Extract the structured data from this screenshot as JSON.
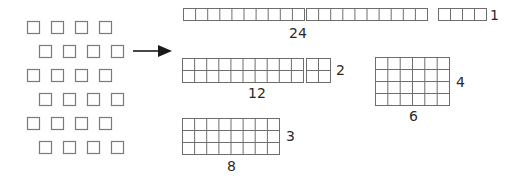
{
  "diagram": {
    "source_squares": {
      "rows": 6,
      "per_row": 4,
      "total": 24
    },
    "arrow": "right-arrow",
    "arrays": [
      {
        "id": "24x1",
        "columns": 24,
        "rows": 1,
        "width_label": "24",
        "height_label": "1",
        "segments": [
          10,
          10,
          4
        ]
      },
      {
        "id": "12x2",
        "columns": 12,
        "rows": 2,
        "width_label": "12",
        "height_label": "2",
        "segments": [
          10,
          2
        ]
      },
      {
        "id": "6x4",
        "columns": 6,
        "rows": 4,
        "width_label": "6",
        "height_label": "4",
        "segments": [
          6
        ]
      },
      {
        "id": "8x3",
        "columns": 8,
        "rows": 3,
        "width_label": "8",
        "height_label": "3",
        "segments": [
          8
        ]
      }
    ]
  },
  "labels": {
    "a24_width": "24",
    "a24_height": "1",
    "a12_width": "12",
    "a12_height": "2",
    "a6_width": "6",
    "a6_height": "4",
    "a8_width": "8",
    "a8_height": "3"
  },
  "colors": {
    "square_stroke": "#7a7a7a",
    "grid_stroke": "#6e6e6e",
    "arrow": "#1a1a1a",
    "text": "#2a2a2a"
  }
}
